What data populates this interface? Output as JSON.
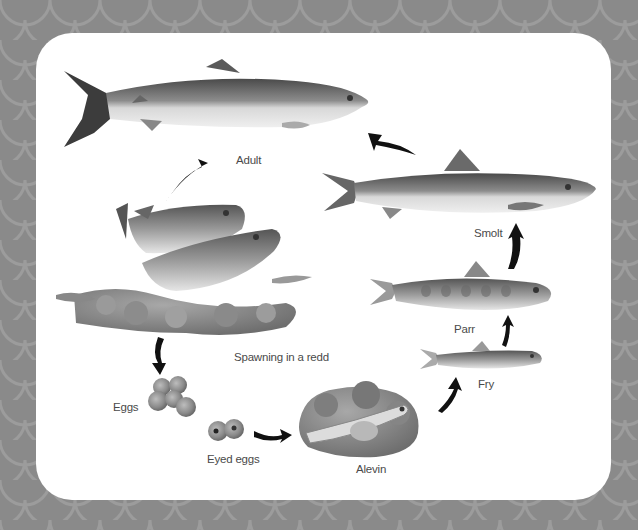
{
  "diagram": {
    "type": "life-cycle",
    "colors": {
      "background": "#8a8a8a",
      "background_pattern": "#9a9a9a",
      "panel": "#ffffff",
      "label_text": "#4a4a4a",
      "arrow": "#111111"
    },
    "stages": [
      {
        "id": "adult",
        "label": "Adult"
      },
      {
        "id": "spawning",
        "label": "Spawning in a redd"
      },
      {
        "id": "eggs",
        "label": "Eggs"
      },
      {
        "id": "eyed-eggs",
        "label": "Eyed eggs"
      },
      {
        "id": "alevin",
        "label": "Alevin"
      },
      {
        "id": "fry",
        "label": "Fry"
      },
      {
        "id": "parr",
        "label": "Parr"
      },
      {
        "id": "smolt",
        "label": "Smolt"
      }
    ],
    "flow": [
      "Adult",
      "Spawning in a redd",
      "Eggs",
      "Eyed eggs",
      "Alevin",
      "Fry",
      "Parr",
      "Smolt",
      "Adult"
    ]
  }
}
